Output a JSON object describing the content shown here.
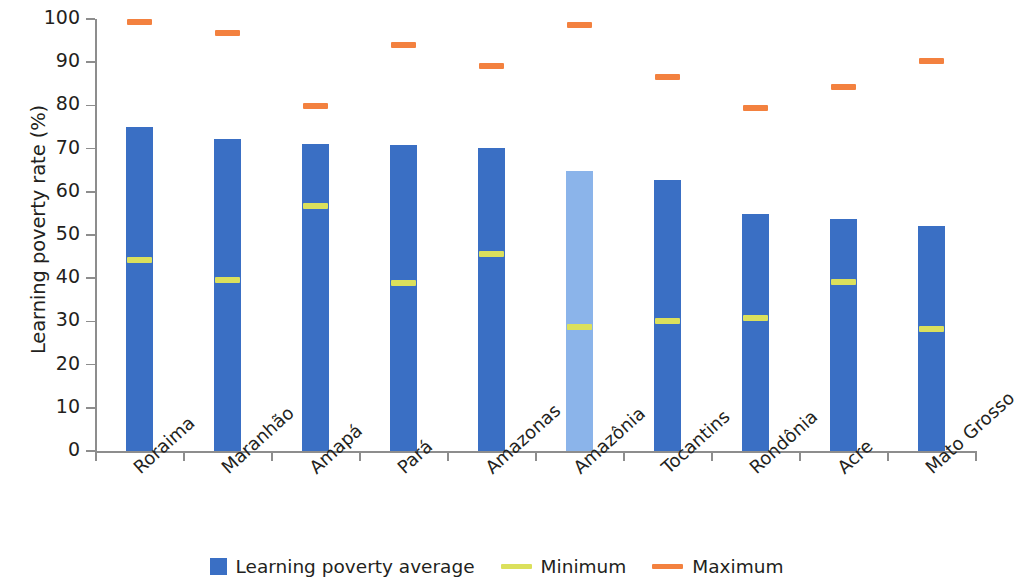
{
  "chart_data": {
    "type": "bar",
    "title": "",
    "xlabel": "",
    "ylabel": "Learning poverty rate (%)",
    "ylim": [
      0,
      100
    ],
    "ytick_labels": [
      "100",
      "90",
      "80",
      "70",
      "60",
      "50",
      "40",
      "30",
      "20",
      "10",
      "0"
    ],
    "ytick_values": [
      100,
      90,
      80,
      70,
      60,
      50,
      40,
      30,
      20,
      10,
      0
    ],
    "grid": false,
    "legend_position": "bottom",
    "categories": [
      "Roraima",
      "Maranhão",
      "Amapá",
      "Pará",
      "Amazonas",
      "Amazônia",
      "Tocantins",
      "Rondônia",
      "Acre",
      "Mato Grosso"
    ],
    "series": [
      {
        "name": "Learning poverty average",
        "type": "bar",
        "color": "#3a6fc4",
        "highlight_color": "#8bb4ea",
        "highlight_index": 5,
        "values": [
          75.0,
          72.2,
          71.0,
          70.8,
          70.1,
          64.8,
          62.7,
          54.9,
          53.6,
          52.1
        ]
      },
      {
        "name": "Minimum",
        "type": "marker",
        "color": "#dbe05c",
        "values": [
          44.2,
          39.6,
          56.7,
          38.9,
          45.7,
          28.7,
          30.1,
          30.9,
          39.1,
          28.2
        ]
      },
      {
        "name": "Maximum",
        "type": "marker",
        "color": "#f3813f",
        "values": [
          99.4,
          96.7,
          79.8,
          94.0,
          89.2,
          98.6,
          86.6,
          79.5,
          84.3,
          90.3
        ]
      }
    ],
    "legend": [
      {
        "label": "Learning poverty average",
        "marker": "square",
        "color": "#3a6fc4"
      },
      {
        "label": "Minimum",
        "marker": "line",
        "color": "#dbe05c"
      },
      {
        "label": "Maximum",
        "marker": "line",
        "color": "#f3813f"
      }
    ]
  }
}
